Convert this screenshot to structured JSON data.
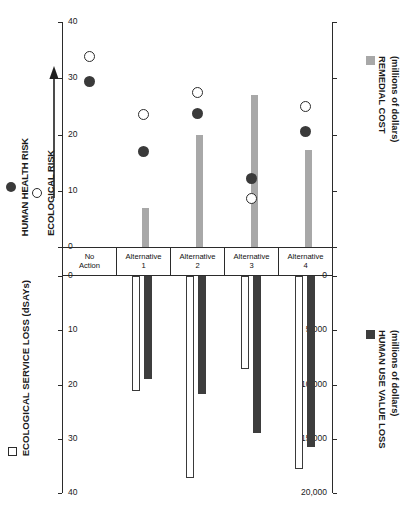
{
  "chart_data": {
    "type": "bar",
    "title": "",
    "categories": [
      "No Action",
      "Alternative 1",
      "Alternative 2",
      "Alternative 3",
      "Alternative 4"
    ],
    "category_lines": [
      [
        "No",
        "Action"
      ],
      [
        "Alternative",
        "1"
      ],
      [
        "Alternative",
        "2"
      ],
      [
        "Alternative",
        "3"
      ],
      [
        "Alternative",
        "4"
      ]
    ],
    "panels": [
      {
        "id": "upper",
        "ylabel_left": "",
        "ylabel_right": "REMEDIAL COST (millions of dollars)",
        "ylim_right": [
          0,
          40
        ],
        "yticks_right": [
          "0",
          "10",
          "20",
          "30",
          "40"
        ],
        "ytick_values_right": [
          0,
          10,
          20,
          30,
          40
        ],
        "yticks_left_count": 5,
        "grid": false,
        "series": [
          {
            "name": "REMEDIAL COST",
            "type": "bar",
            "color": "#a8a8a8",
            "axis": "right",
            "unit": "millions of dollars",
            "values": [
              0,
              7,
              20,
              27,
              17.3
            ]
          },
          {
            "name": "HUMAN HEALTH RISK",
            "type": "scatter",
            "marker": "filled-circle",
            "color": "#3a3a3a",
            "axis": "left-relative",
            "values": [
              0.735,
              0.425,
              0.595,
              0.305,
              0.515
            ]
          },
          {
            "name": "ECOLOGICAL RISK",
            "type": "scatter",
            "marker": "open-circle",
            "color": "#ffffff",
            "axis": "left-relative",
            "values": [
              0.845,
              0.59,
              0.685,
              0.215,
              0.625
            ]
          }
        ]
      },
      {
        "id": "lower",
        "ylabel_left": "ECOLOGICAL SERVICE LOSS (dSAYs)",
        "ylabel_right": "HUMAN USE VALUE LOSS (millions of dollars)",
        "ylim_left": [
          0,
          20000
        ],
        "yticks_left": [
          "0",
          "5,000",
          "10,000",
          "15,000",
          "20,000"
        ],
        "ytick_values_left": [
          0,
          5000,
          10000,
          15000,
          20000
        ],
        "ylim_right": [
          0,
          40
        ],
        "yticks_right": [
          "0",
          "10",
          "20",
          "30",
          "40"
        ],
        "ytick_values_right": [
          0,
          10,
          20,
          30,
          40
        ],
        "grid": false,
        "direction": "downward",
        "series": [
          {
            "name": "ECOLOGICAL SERVICE LOSS",
            "type": "bar",
            "marker": "open-square",
            "color": "#ffffff",
            "axis": "left",
            "unit": "dSAYs",
            "values": [
              0,
              10600,
              18600,
              8600,
              17800
            ]
          },
          {
            "name": "HUMAN USE VALUE LOSS",
            "type": "bar",
            "marker": "filled-square",
            "color": "#3d3d3d",
            "axis": "right",
            "unit": "millions of dollars",
            "values": [
              0,
              19,
              21.8,
              29,
              31.5
            ]
          }
        ]
      }
    ],
    "legend": {
      "upper_left": [
        {
          "label": "HUMAN HEALTH RISK",
          "marker": "filled-circle"
        },
        {
          "label": "ECOLOGICAL RISK",
          "marker": "open-circle"
        }
      ],
      "upper_left_arrow": "increasing-risk-arrow",
      "upper_right": [
        {
          "label_line1": "REMEDIAL COST",
          "label_line2": "(millions of dollars)",
          "marker": "grey-square"
        }
      ],
      "lower_left": [
        {
          "label": "ECOLOGICAL SERVICE LOSS (dSAYs)",
          "marker": "open-square"
        }
      ],
      "lower_right": [
        {
          "label_line1": "HUMAN USE VALUE LOSS",
          "label_line2": "(millions of dollars)",
          "marker": "dark-square"
        }
      ]
    },
    "colors": {
      "remedial_cost": "#a8a8a8",
      "human_use_value_loss": "#3d3d3d",
      "ecological_service_loss": "#ffffff",
      "axis": "#2b2b2b"
    }
  }
}
